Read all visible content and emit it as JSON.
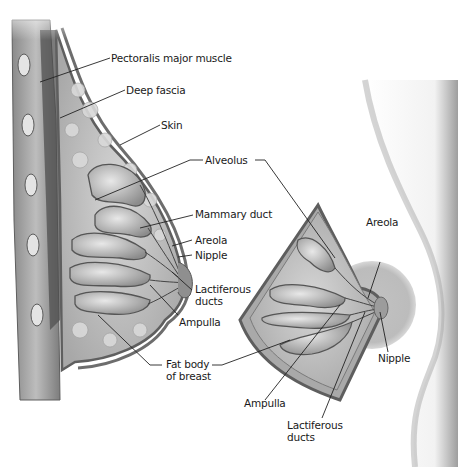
{
  "diagram": {
    "colors": {
      "tissue_dark": "#6b6b6b",
      "tissue_mid": "#9a9a9a",
      "tissue_light": "#c9c9c9",
      "skin_shadow": "#b5b5b5",
      "areola": "#bdbdbd",
      "leader_line": "#222222"
    },
    "left_view": {
      "labels": {
        "pectoralis": "Pectoralis major muscle",
        "deep_fascia": "Deep fascia",
        "skin": "Skin",
        "alveolus": "Alveolus",
        "mammary_duct": "Mammary duct",
        "areola": "Areola",
        "nipple": "Nipple",
        "lactiferous_1": "Lactiferous",
        "lactiferous_2": "ducts",
        "ampulla": "Ampulla",
        "fat_body_1": "Fat body",
        "fat_body_2": "of breast"
      }
    },
    "right_view": {
      "labels": {
        "areola": "Areola",
        "nipple": "Nipple",
        "ampulla": "Ampulla",
        "lactiferous_1": "Lactiferous",
        "lactiferous_2": "ducts"
      }
    }
  }
}
